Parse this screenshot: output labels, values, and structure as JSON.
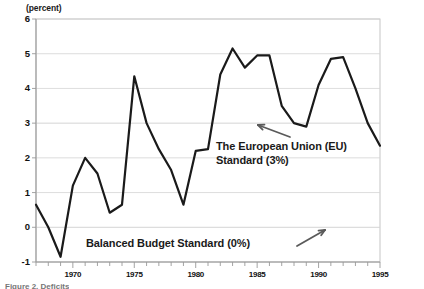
{
  "figure": {
    "unit_label": "(percent)",
    "caption_clipped": "Figure 2. Deficits"
  },
  "annotations": [
    {
      "id": "eu-standard",
      "line1": "The European Union (EU)",
      "line2": "Standard (3%)"
    },
    {
      "id": "balanced-budget",
      "line1": "Balanced Budget Standard (0%)",
      "line2": ""
    }
  ],
  "colors": {
    "line": "#1a1a1a",
    "grid": "#d4d4d4",
    "axis": "#9a9a9a",
    "arrow": "#5a5a5a",
    "text": "#111111",
    "background": "#ffffff",
    "border": "#bfbfbf"
  },
  "chart_data": {
    "type": "line",
    "title": "",
    "subtitle": "",
    "xlabel": "",
    "ylabel": "(percent)",
    "ylim": [
      -1,
      6
    ],
    "xlim": [
      1967,
      1995
    ],
    "yticks": [
      6,
      5,
      4,
      3,
      2,
      1,
      0,
      -1
    ],
    "ytick_labels": [
      "6",
      "5",
      "4",
      "3",
      "2",
      "1",
      "0",
      "-1"
    ],
    "xticks": [
      1967,
      1968,
      1969,
      1970,
      1971,
      1972,
      1973,
      1974,
      1975,
      1976,
      1977,
      1978,
      1979,
      1980,
      1981,
      1982,
      1983,
      1984,
      1985,
      1986,
      1987,
      1988,
      1989,
      1990,
      1991,
      1992,
      1993,
      1994,
      1995
    ],
    "xtick_labels_shown": [
      "1970",
      "1975",
      "1980",
      "1985",
      "1990",
      "1995"
    ],
    "xtick_label_years": [
      1970,
      1975,
      1980,
      1985,
      1990,
      1995
    ],
    "grid": true,
    "legend": "none",
    "reference_lines": [
      {
        "name": "eu-standard",
        "value": 3,
        "label": "The European Union (EU) Standard (3%)"
      },
      {
        "name": "balanced-budget",
        "value": 0,
        "label": "Balanced Budget Standard (0%)"
      }
    ],
    "x": [
      1967,
      1968,
      1969,
      1970,
      1971,
      1972,
      1973,
      1974,
      1975,
      1976,
      1977,
      1978,
      1979,
      1980,
      1981,
      1982,
      1983,
      1984,
      1985,
      1986,
      1987,
      1988,
      1989,
      1990,
      1991,
      1992,
      1993,
      1994,
      1995
    ],
    "series": [
      {
        "name": "Deficit",
        "values": [
          0.65,
          0.0,
          -0.85,
          1.2,
          2.0,
          1.55,
          0.42,
          0.65,
          4.35,
          3.0,
          2.25,
          1.65,
          0.65,
          2.2,
          2.25,
          4.4,
          5.15,
          4.6,
          4.95,
          4.95,
          3.5,
          3.0,
          2.9,
          4.1,
          4.85,
          4.9,
          4.0,
          3.0,
          2.35
        ]
      }
    ]
  }
}
